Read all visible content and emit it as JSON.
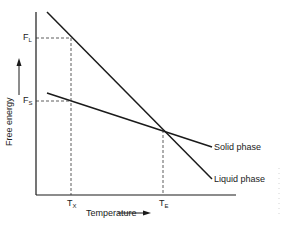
{
  "diagram": {
    "y_axis_label": "Free energy",
    "x_axis_label": "Temperature",
    "y_ticks": [
      {
        "main": "F",
        "sub": "L"
      },
      {
        "main": "F",
        "sub": "S"
      }
    ],
    "x_ticks": [
      {
        "main": "T",
        "sub": "X"
      },
      {
        "main": "T",
        "sub": "E"
      }
    ],
    "curves": [
      {
        "name": "Solid phase",
        "label": "Solid phase"
      },
      {
        "name": "Liquid phase",
        "label": "Liquid phase"
      }
    ],
    "colors": {
      "line": "#1a1a1a",
      "dashed": "#333333",
      "background": "#ffffff"
    }
  }
}
